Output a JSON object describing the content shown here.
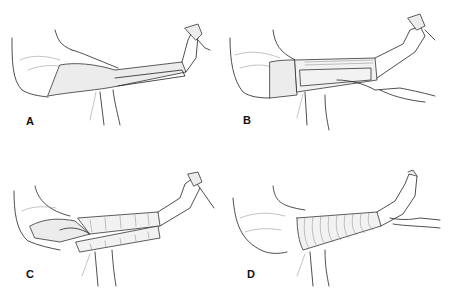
{
  "figure": {
    "panels": [
      {
        "id": "A",
        "label": "A",
        "description": "Leg extended, pad/splint placed along the lower leg"
      },
      {
        "id": "B",
        "label": "B",
        "description": "Assistant holds the pad in place along the leg while the foot is supported"
      },
      {
        "id": "C",
        "label": "C",
        "description": "Bandage wrapped in spiral turns over the pad"
      },
      {
        "id": "D",
        "label": "D",
        "description": "Completed spiral bandage from knee to ankle, heel supported by hand"
      }
    ]
  }
}
